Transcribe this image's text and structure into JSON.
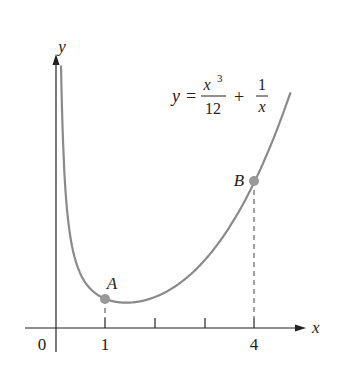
{
  "chart_data": {
    "type": "line",
    "title": "",
    "equation": "y = x^3/12 + 1/x",
    "equation_parts": {
      "y": "y",
      "eq": "=",
      "num1": "x",
      "exp": "3",
      "den1": "12",
      "plus": "+",
      "num2": "1",
      "den2": "x"
    },
    "xlabel": "x",
    "ylabel": "y",
    "x_ticks": [
      1,
      2,
      3,
      4
    ],
    "x_tick_labels": {
      "origin": "0",
      "one": "1",
      "four": "4"
    },
    "points": [
      {
        "label": "A",
        "x": 1,
        "y": 1.083
      },
      {
        "label": "B",
        "x": 4,
        "y": 5.583
      }
    ],
    "xlim": [
      -0.6,
      5
    ],
    "ylim": [
      -1,
      11
    ],
    "grid": false,
    "curve_color": "#8a8a8a",
    "point_color": "#999999"
  }
}
